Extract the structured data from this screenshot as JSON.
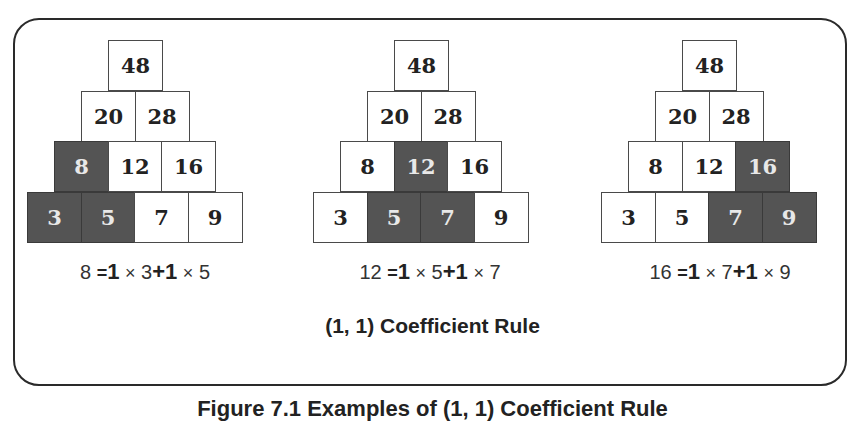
{
  "figure": {
    "rule_title": "(1, 1) Coefficient Rule",
    "caption": "Figure 7.1 Examples of (1, 1) Coefficient Rule",
    "colors": {
      "highlight_fill": "#545454",
      "cell_fill": "#ffffff",
      "border": "#2a2a2a"
    }
  },
  "pyramids": [
    {
      "rows": [
        [
          {
            "v": "48",
            "hl": false
          }
        ],
        [
          {
            "v": "20",
            "hl": false
          },
          {
            "v": "28",
            "hl": false
          }
        ],
        [
          {
            "v": "8",
            "hl": true
          },
          {
            "v": "12",
            "hl": false
          },
          {
            "v": "16",
            "hl": false
          }
        ],
        [
          {
            "v": "3",
            "hl": true
          },
          {
            "v": "5",
            "hl": true
          },
          {
            "v": "7",
            "hl": false
          },
          {
            "v": "9",
            "hl": false
          }
        ]
      ],
      "formula": {
        "result": "8",
        "eq": "=",
        "c1": "1",
        "times1": "×",
        "a": "3",
        "plus": "+",
        "c2": "1",
        "times2": "×",
        "b": "5"
      }
    },
    {
      "rows": [
        [
          {
            "v": "48",
            "hl": false
          }
        ],
        [
          {
            "v": "20",
            "hl": false
          },
          {
            "v": "28",
            "hl": false
          }
        ],
        [
          {
            "v": "8",
            "hl": false
          },
          {
            "v": "12",
            "hl": true
          },
          {
            "v": "16",
            "hl": false
          }
        ],
        [
          {
            "v": "3",
            "hl": false
          },
          {
            "v": "5",
            "hl": true
          },
          {
            "v": "7",
            "hl": true
          },
          {
            "v": "9",
            "hl": false
          }
        ]
      ],
      "formula": {
        "result": "12",
        "eq": "=",
        "c1": "1",
        "times1": "×",
        "a": "5",
        "plus": "+",
        "c2": "1",
        "times2": "×",
        "b": "7"
      }
    },
    {
      "rows": [
        [
          {
            "v": "48",
            "hl": false
          }
        ],
        [
          {
            "v": "20",
            "hl": false
          },
          {
            "v": "28",
            "hl": false
          }
        ],
        [
          {
            "v": "8",
            "hl": false
          },
          {
            "v": "12",
            "hl": false
          },
          {
            "v": "16",
            "hl": true
          }
        ],
        [
          {
            "v": "3",
            "hl": false
          },
          {
            "v": "5",
            "hl": false
          },
          {
            "v": "7",
            "hl": true
          },
          {
            "v": "9",
            "hl": true
          }
        ]
      ],
      "formula": {
        "result": "16",
        "eq": "=",
        "c1": "1",
        "times1": "×",
        "a": "7",
        "plus": "+",
        "c2": "1",
        "times2": "×",
        "b": "9"
      }
    }
  ]
}
